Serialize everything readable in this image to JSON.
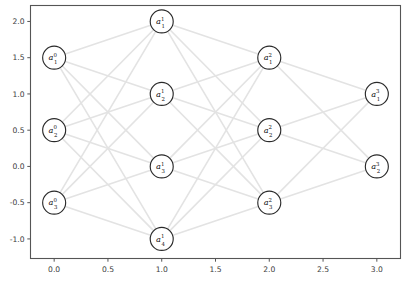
{
  "figure": {
    "width": 408,
    "height": 285,
    "background_color": "#ffffff",
    "title": "",
    "xlabel": "",
    "ylabel": ""
  },
  "axes": {
    "frame_color": "#555555",
    "x_ticks": [
      "0.0",
      "0.5",
      "1.0",
      "1.5",
      "2.0",
      "2.5",
      "3.0"
    ],
    "x_tick_values": [
      0.0,
      0.5,
      1.0,
      1.5,
      2.0,
      2.5,
      3.0
    ],
    "y_ticks": [
      "2.0",
      "1.5",
      "1.0",
      "0.5",
      "0.0",
      "-0.5",
      "-1.0"
    ],
    "y_tick_values": [
      2.0,
      1.5,
      1.0,
      0.5,
      0.0,
      -0.5,
      -1.0
    ],
    "xlim": [
      -0.22,
      3.22
    ],
    "ylim": [
      -1.27,
      2.22
    ],
    "grid": false
  },
  "chart_data": {
    "type": "diagram",
    "subtype": "neural-network-graph",
    "title": "",
    "xlabel": "",
    "ylabel": "",
    "xlim": [
      -0.22,
      3.22
    ],
    "ylim": [
      -1.27,
      2.22
    ],
    "grid": false,
    "legend": null,
    "node_radius_px": 11.5,
    "node_fill": "#ffffff",
    "node_stroke": "#2a2a2a",
    "edge_color": "#e3e3e3",
    "edge_width": 1.6,
    "layers": [
      {
        "index": 0,
        "x": 0.0,
        "nodes": [
          {
            "label": "a",
            "sup": "0",
            "sub": "1",
            "x": 0.0,
            "y": 1.5
          },
          {
            "label": "a",
            "sup": "0",
            "sub": "2",
            "x": 0.0,
            "y": 0.5
          },
          {
            "label": "a",
            "sup": "0",
            "sub": "3",
            "x": 0.0,
            "y": -0.5
          }
        ]
      },
      {
        "index": 1,
        "x": 1.0,
        "nodes": [
          {
            "label": "a",
            "sup": "1",
            "sub": "1",
            "x": 1.0,
            "y": 2.0
          },
          {
            "label": "a",
            "sup": "1",
            "sub": "2",
            "x": 1.0,
            "y": 1.0
          },
          {
            "label": "a",
            "sup": "1",
            "sub": "3",
            "x": 1.0,
            "y": 0.0
          },
          {
            "label": "a",
            "sup": "1",
            "sub": "4",
            "x": 1.0,
            "y": -1.0
          }
        ]
      },
      {
        "index": 2,
        "x": 2.0,
        "nodes": [
          {
            "label": "a",
            "sup": "2",
            "sub": "1",
            "x": 2.0,
            "y": 1.5
          },
          {
            "label": "a",
            "sup": "2",
            "sub": "2",
            "x": 2.0,
            "y": 0.5
          },
          {
            "label": "a",
            "sup": "2",
            "sub": "3",
            "x": 2.0,
            "y": -0.5
          }
        ]
      },
      {
        "index": 3,
        "x": 3.0,
        "nodes": [
          {
            "label": "a",
            "sup": "3",
            "sub": "1",
            "x": 3.0,
            "y": 1.0
          },
          {
            "label": "a",
            "sup": "3",
            "sub": "2",
            "x": 3.0,
            "y": 0.0
          }
        ]
      }
    ],
    "edges_fully_connected_between_adjacent_layers": true,
    "edge_counts": [
      12,
      12,
      6
    ],
    "total_edges": 30
  }
}
